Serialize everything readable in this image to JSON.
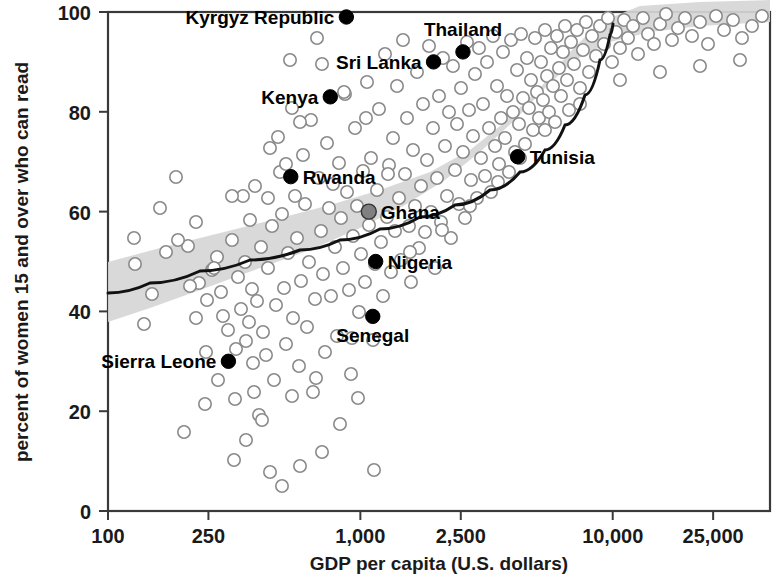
{
  "chart_data": {
    "type": "scatter",
    "title": "",
    "xlabel": "GDP per capita (U.S. dollars)",
    "ylabel": "percent of women 15 and over who can read",
    "xscale": "log",
    "xlim": [
      100,
      42000
    ],
    "ylim": [
      0,
      100
    ],
    "grid": false,
    "legend": null,
    "xticks": [
      100,
      250,
      1000,
      2500,
      10000,
      25000
    ],
    "xtick_labels": [
      "100",
      "250",
      "1,000",
      "2,500",
      "10,000",
      "25,000"
    ],
    "yticks": [
      0,
      20,
      40,
      60,
      80,
      100
    ],
    "ytick_labels": [
      "0",
      "20",
      "40",
      "60",
      "80",
      "100"
    ],
    "annotations": [
      {
        "label": "Kyrgyz Republic",
        "x": 880,
        "y": 99,
        "marker": "filled",
        "label_side": "left"
      },
      {
        "label": "Sri Lanka",
        "x": 1950,
        "y": 90,
        "marker": "filled",
        "label_side": "left"
      },
      {
        "label": "Thailand",
        "x": 2550,
        "y": 92,
        "marker": "filled",
        "label_side": "above"
      },
      {
        "label": "Kenya",
        "x": 760,
        "y": 83,
        "marker": "filled",
        "label_side": "left"
      },
      {
        "label": "Tunisia",
        "x": 4200,
        "y": 71,
        "marker": "filled",
        "label_side": "right"
      },
      {
        "label": "Rwanda",
        "x": 530,
        "y": 67,
        "marker": "filled",
        "label_side": "right"
      },
      {
        "label": "Ghana",
        "x": 1080,
        "y": 60,
        "marker": "mid",
        "label_side": "right"
      },
      {
        "label": "Nigeria",
        "x": 1150,
        "y": 50,
        "marker": "filled",
        "label_side": "right"
      },
      {
        "label": "Senegal",
        "x": 1120,
        "y": 39,
        "marker": "filled",
        "label_side": "below"
      },
      {
        "label": "Sierra Leone",
        "x": 300,
        "y": 30,
        "marker": "filled",
        "label_side": "left"
      }
    ],
    "fit_line": {
      "description": "smoothed regression curve with shaded confidence band",
      "points": [
        [
          108,
          293
        ],
        [
          150,
          283
        ],
        [
          200,
          271
        ],
        [
          250,
          260
        ],
        [
          300,
          250
        ],
        [
          340,
          240
        ],
        [
          380,
          229
        ],
        [
          420,
          217
        ],
        [
          455,
          205
        ],
        [
          490,
          190
        ],
        [
          520,
          172
        ],
        [
          545,
          150
        ],
        [
          565,
          125
        ],
        [
          585,
          95
        ],
        [
          600,
          60
        ],
        [
          610,
          35
        ],
        [
          613,
          24
        ]
      ]
    },
    "confidence_band": {
      "upper": [
        [
          108,
          262
        ],
        [
          160,
          248
        ],
        [
          220,
          233
        ],
        [
          280,
          218
        ],
        [
          330,
          205
        ],
        [
          380,
          190
        ],
        [
          430,
          172
        ],
        [
          470,
          150
        ],
        [
          505,
          122
        ],
        [
          540,
          88
        ],
        [
          570,
          52
        ],
        [
          600,
          22
        ],
        [
          640,
          6
        ],
        [
          700,
          2
        ],
        [
          770,
          0
        ]
      ],
      "lower": [
        [
          770,
          22
        ],
        [
          700,
          26
        ],
        [
          650,
          32
        ],
        [
          610,
          42
        ],
        [
          575,
          60
        ],
        [
          545,
          88
        ],
        [
          515,
          120
        ],
        [
          480,
          152
        ],
        [
          445,
          180
        ],
        [
          405,
          205
        ],
        [
          360,
          228
        ],
        [
          310,
          250
        ],
        [
          260,
          268
        ],
        [
          200,
          290
        ],
        [
          150,
          308
        ],
        [
          108,
          322
        ]
      ]
    },
    "background_points": [
      [
        134,
        238
      ],
      [
        135,
        264
      ],
      [
        160,
        208
      ],
      [
        176,
        177
      ],
      [
        184,
        432
      ],
      [
        188,
        246
      ],
      [
        196,
        222
      ],
      [
        199,
        283
      ],
      [
        205,
        404
      ],
      [
        207,
        300
      ],
      [
        212,
        270
      ],
      [
        217,
        257
      ],
      [
        221,
        292
      ],
      [
        223,
        316
      ],
      [
        228,
        330
      ],
      [
        232,
        240
      ],
      [
        235,
        399
      ],
      [
        236,
        349
      ],
      [
        238,
        277
      ],
      [
        241,
        309
      ],
      [
        243,
        196
      ],
      [
        245,
        262
      ],
      [
        246,
        341
      ],
      [
        249,
        322
      ],
      [
        252,
        289
      ],
      [
        253,
        363
      ],
      [
        255,
        186
      ],
      [
        257,
        301
      ],
      [
        259,
        415
      ],
      [
        261,
        247
      ],
      [
        263,
        332
      ],
      [
        266,
        355
      ],
      [
        268,
        268
      ],
      [
        270,
        148
      ],
      [
        272,
        226
      ],
      [
        274,
        380
      ],
      [
        276,
        305
      ],
      [
        278,
        137
      ],
      [
        280,
        172
      ],
      [
        282,
        214
      ],
      [
        284,
        288
      ],
      [
        286,
        344
      ],
      [
        288,
        253
      ],
      [
        290,
        60
      ],
      [
        292,
        108
      ],
      [
        293,
        318
      ],
      [
        295,
        196
      ],
      [
        297,
        238
      ],
      [
        299,
        366
      ],
      [
        301,
        281
      ],
      [
        303,
        155
      ],
      [
        305,
        204
      ],
      [
        307,
        327
      ],
      [
        309,
        262
      ],
      [
        311,
        120
      ],
      [
        313,
        392
      ],
      [
        315,
        299
      ],
      [
        317,
        38
      ],
      [
        319,
        178
      ],
      [
        321,
        231
      ],
      [
        323,
        274
      ],
      [
        325,
        352
      ],
      [
        327,
        143
      ],
      [
        329,
        208
      ],
      [
        331,
        296
      ],
      [
        333,
        184
      ],
      [
        335,
        247
      ],
      [
        337,
        336
      ],
      [
        339,
        163
      ],
      [
        341,
        218
      ],
      [
        343,
        268
      ],
      [
        345,
        94
      ],
      [
        347,
        192
      ],
      [
        349,
        290
      ],
      [
        351,
        374
      ],
      [
        353,
        236
      ],
      [
        355,
        128
      ],
      [
        357,
        206
      ],
      [
        359,
        312
      ],
      [
        361,
        254
      ],
      [
        363,
        171
      ],
      [
        365,
        282
      ],
      [
        367,
        82
      ],
      [
        369,
        225
      ],
      [
        371,
        158
      ],
      [
        373,
        340
      ],
      [
        375,
        264
      ],
      [
        377,
        190
      ],
      [
        379,
        109
      ],
      [
        381,
        242
      ],
      [
        383,
        296
      ],
      [
        385,
        54
      ],
      [
        387,
        217
      ],
      [
        389,
        165
      ],
      [
        391,
        272
      ],
      [
        393,
        138
      ],
      [
        395,
        231
      ],
      [
        397,
        86
      ],
      [
        399,
        198
      ],
      [
        401,
        260
      ],
      [
        403,
        40
      ],
      [
        405,
        174
      ],
      [
        407,
        118
      ],
      [
        409,
        226
      ],
      [
        411,
        282
      ],
      [
        413,
        150
      ],
      [
        415,
        206
      ],
      [
        417,
        72
      ],
      [
        419,
        248
      ],
      [
        421,
        186
      ],
      [
        423,
        104
      ],
      [
        425,
        232
      ],
      [
        427,
        160
      ],
      [
        429,
        46
      ],
      [
        431,
        212
      ],
      [
        433,
        128
      ],
      [
        435,
        268
      ],
      [
        437,
        178
      ],
      [
        439,
        96
      ],
      [
        441,
        222
      ],
      [
        443,
        58
      ],
      [
        445,
        146
      ],
      [
        447,
        196
      ],
      [
        449,
        112
      ],
      [
        451,
        238
      ],
      [
        453,
        66
      ],
      [
        455,
        170
      ],
      [
        457,
        124
      ],
      [
        459,
        204
      ],
      [
        461,
        88
      ],
      [
        463,
        152
      ],
      [
        465,
        218
      ],
      [
        467,
        42
      ],
      [
        469,
        110
      ],
      [
        471,
        180
      ],
      [
        473,
        136
      ],
      [
        475,
        74
      ],
      [
        477,
        198
      ],
      [
        479,
        48
      ],
      [
        481,
        158
      ],
      [
        483,
        104
      ],
      [
        485,
        176
      ],
      [
        487,
        62
      ],
      [
        489,
        128
      ],
      [
        491,
        192
      ],
      [
        493,
        36
      ],
      [
        495,
        146
      ],
      [
        497,
        86
      ],
      [
        499,
        164
      ],
      [
        501,
        118
      ],
      [
        503,
        52
      ],
      [
        505,
        138
      ],
      [
        507,
        96
      ],
      [
        509,
        172
      ],
      [
        511,
        40
      ],
      [
        513,
        112
      ],
      [
        515,
        152
      ],
      [
        517,
        70
      ],
      [
        519,
        124
      ],
      [
        521,
        34
      ],
      [
        523,
        98
      ],
      [
        525,
        144
      ],
      [
        527,
        58
      ],
      [
        529,
        108
      ],
      [
        531,
        80
      ],
      [
        533,
        130
      ],
      [
        535,
        38
      ],
      [
        537,
        92
      ],
      [
        539,
        118
      ],
      [
        541,
        62
      ],
      [
        543,
        100
      ],
      [
        545,
        30
      ],
      [
        547,
        76
      ],
      [
        549,
        112
      ],
      [
        551,
        48
      ],
      [
        553,
        86
      ],
      [
        555,
        122
      ],
      [
        557,
        36
      ],
      [
        559,
        68
      ],
      [
        561,
        96
      ],
      [
        563,
        52
      ],
      [
        565,
        26
      ],
      [
        567,
        80
      ],
      [
        569,
        110
      ],
      [
        571,
        42
      ],
      [
        574,
        64
      ],
      [
        577,
        30
      ],
      [
        580,
        88
      ],
      [
        583,
        50
      ],
      [
        586,
        22
      ],
      [
        589,
        72
      ],
      [
        592,
        36
      ],
      [
        596,
        56
      ],
      [
        600,
        26
      ],
      [
        604,
        44
      ],
      [
        608,
        18
      ],
      [
        612,
        62
      ],
      [
        616,
        32
      ],
      [
        620,
        48
      ],
      [
        624,
        20
      ],
      [
        628,
        38
      ],
      [
        633,
        26
      ],
      [
        638,
        54
      ],
      [
        643,
        18
      ],
      [
        648,
        34
      ],
      [
        654,
        44
      ],
      [
        660,
        24
      ],
      [
        666,
        14
      ],
      [
        672,
        40
      ],
      [
        678,
        28
      ],
      [
        685,
        18
      ],
      [
        692,
        36
      ],
      [
        700,
        22
      ],
      [
        708,
        44
      ],
      [
        716,
        16
      ],
      [
        724,
        30
      ],
      [
        733,
        20
      ],
      [
        742,
        38
      ],
      [
        752,
        26
      ],
      [
        762,
        16
      ],
      [
        740,
        60
      ],
      [
        700,
        66
      ],
      [
        660,
        72
      ],
      [
        620,
        80
      ],
      [
        580,
        104
      ],
      [
        545,
        130
      ],
      [
        520,
        158
      ],
      [
        498,
        182
      ],
      [
        470,
        206
      ],
      [
        442,
        230
      ],
      [
        410,
        252
      ],
      [
        388,
        174
      ],
      [
        366,
        118
      ],
      [
        344,
        92
      ],
      [
        322,
        64
      ],
      [
        300,
        122
      ],
      [
        286,
        164
      ],
      [
        268,
        198
      ],
      [
        250,
        220
      ],
      [
        232,
        196
      ],
      [
        214,
        268
      ],
      [
        196,
        318
      ],
      [
        178,
        240
      ],
      [
        300,
        466
      ],
      [
        322,
        452
      ],
      [
        282,
        486
      ],
      [
        340,
        424
      ],
      [
        262,
        420
      ],
      [
        246,
        440
      ],
      [
        358,
        398
      ],
      [
        374,
        470
      ],
      [
        292,
        396
      ],
      [
        316,
        378
      ],
      [
        218,
        380
      ],
      [
        352,
        338
      ],
      [
        270,
        472
      ],
      [
        234,
        460
      ],
      [
        254,
        392
      ],
      [
        206,
        352
      ],
      [
        190,
        286
      ],
      [
        166,
        252
      ],
      [
        152,
        294
      ],
      [
        144,
        324
      ]
    ]
  }
}
